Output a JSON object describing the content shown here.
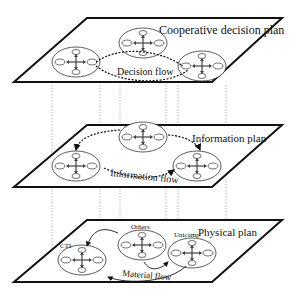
{
  "header_clipped_text": "",
  "planes": {
    "decision": {
      "label": "Cooperative decision plan",
      "flow_label": "Decision flow"
    },
    "information": {
      "label": "Information plan",
      "flow_label": "Information flow"
    },
    "physical": {
      "label": "Physical plan",
      "flow_label": "Material flow"
    }
  },
  "nodes": {
    "left": "CTI",
    "middle": "Others",
    "right": "Unicamp"
  },
  "colors": {
    "line": "#111111",
    "plane_fill": "#ffffff",
    "projection": "#888888"
  }
}
